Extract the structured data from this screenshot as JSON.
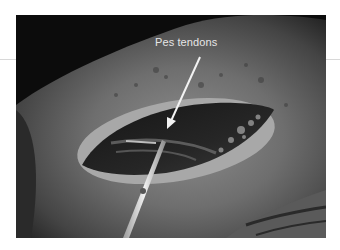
{
  "figure": {
    "annotation": {
      "label": "Pes tendons",
      "arrow_color": "#f2f2f2",
      "label_color": "#e6e6e6"
    },
    "colors": {
      "background": "#ffffff",
      "skin_light": "#8a8a8a",
      "skin_dark": "#3a3a3a",
      "shadow": "#0a0a0a",
      "wound_interior": "#1e1e1e",
      "instrument": "#d9d9d9"
    }
  }
}
